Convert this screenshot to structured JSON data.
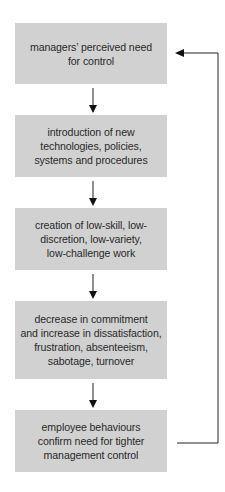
{
  "diagram": {
    "type": "flowchart-cycle",
    "box_fill": "#d1d1d1",
    "line_color": "#222222",
    "nodes": [
      {
        "id": "n1",
        "label": "managers' perceived need for control",
        "lines": [
          "managers’ perceived need",
          "for control"
        ]
      },
      {
        "id": "n2",
        "label": "introduction of new technologies, policies, systems and procedures",
        "lines": [
          "introduction of new",
          "technologies, policies,",
          "systems and procedures"
        ]
      },
      {
        "id": "n3",
        "label": "creation of low-skill, low-discretion, low-variety, low-challenge work",
        "lines": [
          "creation of low-skill, low-",
          "discretion, low-variety,",
          "low-challenge work"
        ]
      },
      {
        "id": "n4",
        "label": "decrease in commitment and increase in dissatisfaction, frustration, absenteeism, sabotage, turnover",
        "lines": [
          "decrease in commitment",
          "and increase in dissatisfaction,",
          "frustration, absenteeism,",
          "sabotage, turnover"
        ]
      },
      {
        "id": "n5",
        "label": "employee behaviours confirm need for tighter management control",
        "lines": [
          "employee behaviours",
          "confirm need for tighter",
          "management control"
        ]
      }
    ],
    "edges": [
      {
        "from": "n1",
        "to": "n2",
        "kind": "down-arrow"
      },
      {
        "from": "n2",
        "to": "n3",
        "kind": "down-arrow"
      },
      {
        "from": "n3",
        "to": "n4",
        "kind": "down-arrow"
      },
      {
        "from": "n4",
        "to": "n5",
        "kind": "down-arrow"
      },
      {
        "from": "n5",
        "to": "n1",
        "kind": "feedback-loop-right"
      }
    ]
  }
}
